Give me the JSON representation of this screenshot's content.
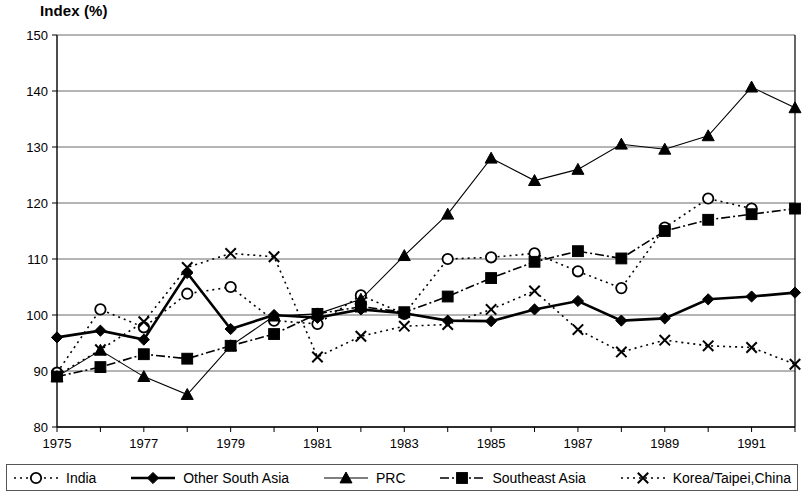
{
  "chart_data": {
    "type": "line",
    "title": "Index (%)",
    "ylabel": "Index (%)",
    "xlabel": "",
    "ylim": [
      80,
      150
    ],
    "yticks": [
      80,
      90,
      100,
      110,
      120,
      130,
      140,
      150
    ],
    "grid": true,
    "legend_position": "bottom",
    "xlim": [
      1975,
      1992
    ],
    "x": [
      1975,
      1976,
      1977,
      1978,
      1979,
      1980,
      1981,
      1982,
      1983,
      1984,
      1985,
      1986,
      1987,
      1988,
      1989,
      1990,
      1991,
      1992
    ],
    "xticks": [
      1975,
      1977,
      1979,
      1981,
      1983,
      1985,
      1987,
      1989,
      1991
    ],
    "xtick_labels": [
      "1975",
      "1977",
      "1979",
      "1981",
      "1983",
      "1985",
      "1987",
      "1989",
      "1991"
    ],
    "series": [
      {
        "name": "India",
        "marker": "open-circle",
        "line_style": "dotted",
        "color": "#000000",
        "values": [
          89.7,
          101.0,
          97.8,
          103.8,
          105.0,
          99.0,
          98.4,
          103.5,
          100.2,
          110.0,
          110.3,
          111.0,
          107.8,
          104.8,
          115.6,
          120.8,
          119.0,
          null
        ]
      },
      {
        "name": "Other South Asia",
        "marker": "filled-diamond",
        "line_style": "solid",
        "color": "#000000",
        "values": [
          96.0,
          97.2,
          95.6,
          107.5,
          97.5,
          100.0,
          99.5,
          101.0,
          100.3,
          99.0,
          98.9,
          101.0,
          102.5,
          99.0,
          99.4,
          102.8,
          103.3,
          104.0
        ]
      },
      {
        "name": "PRC",
        "marker": "filled-triangle",
        "line_style": "solid-thin",
        "color": "#000000",
        "values": [
          89.0,
          93.7,
          89.0,
          85.8,
          94.5,
          99.8,
          100.2,
          102.8,
          110.6,
          118.0,
          128.0,
          124.0,
          126.0,
          130.5,
          129.6,
          132.0,
          140.7,
          137.0
        ]
      },
      {
        "name": "Southeast Asia",
        "marker": "filled-square",
        "line_style": "dash-dot",
        "color": "#000000",
        "values": [
          89.0,
          90.7,
          93.0,
          92.2,
          94.5,
          96.6,
          100.2,
          101.5,
          100.5,
          103.3,
          106.6,
          109.5,
          111.4,
          110.1,
          115.0,
          117.0,
          118.0,
          119.0
        ]
      },
      {
        "name": "Korea/Taipei,China",
        "marker": "cross",
        "line_style": "dotted",
        "color": "#000000",
        "values": [
          89.2,
          93.8,
          98.8,
          108.5,
          111.0,
          110.4,
          92.5,
          96.2,
          98.0,
          98.3,
          101.0,
          104.3,
          97.4,
          93.4,
          95.5,
          94.5,
          94.2,
          91.2
        ]
      }
    ]
  },
  "legend": {
    "entries": [
      {
        "label": "India",
        "marker": "open-circle",
        "line_style": "dotted"
      },
      {
        "label": "Other South Asia",
        "marker": "filled-diamond",
        "line_style": "solid"
      },
      {
        "label": "PRC",
        "marker": "filled-triangle",
        "line_style": "solid-thin"
      },
      {
        "label": "Southeast Asia",
        "marker": "filled-square",
        "line_style": "dash-dot"
      },
      {
        "label": "Korea/Taipei,China",
        "marker": "cross",
        "line_style": "dotted"
      }
    ]
  }
}
